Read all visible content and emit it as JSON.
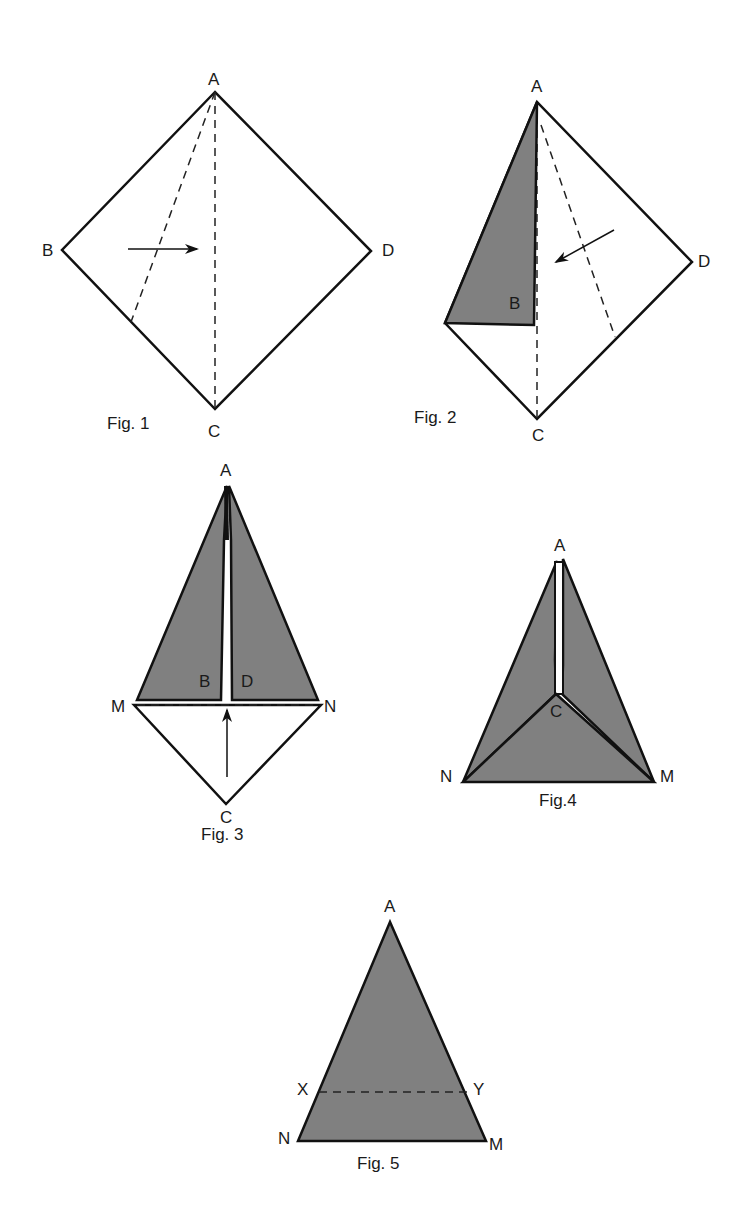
{
  "colors": {
    "shade": "#808080",
    "line": "#111111",
    "paper": "#ffffff"
  },
  "figures": [
    {
      "id": "fig1",
      "caption": "Fig. 1",
      "labels": {
        "A": "A",
        "B": "B",
        "C": "C",
        "D": "D"
      },
      "description": "Square ABCD with dashed diagonal AC and dashed fold line from A to BC; arrow points right (fold B toward AC)"
    },
    {
      "id": "fig2",
      "caption": "Fig. 2",
      "labels": {
        "A": "A",
        "B": "B",
        "C": "C",
        "D": "D"
      },
      "description": "B folded onto AC (shaded triangle); dashed fold line from A to CD; arrow points left-down (fold D toward AC)"
    },
    {
      "id": "fig3",
      "caption": "Fig. 3",
      "labels": {
        "A": "A",
        "B": "B",
        "D": "D",
        "M": "M",
        "N": "N",
        "C": "C"
      },
      "description": "Both flaps folded (shaded), dashed fold line MN; arrow points up (fold C up)"
    },
    {
      "id": "fig4",
      "caption": "Fig.4",
      "labels": {
        "A": "A",
        "C": "C",
        "N": "N",
        "M": "M"
      },
      "description": "Flipped over; C folded up forming triangle ANM with lines from C to N and M"
    },
    {
      "id": "fig5",
      "caption": "Fig. 5",
      "labels": {
        "A": "A",
        "X": "X",
        "Y": "Y",
        "N": "N",
        "M": "M"
      },
      "description": "Triangle ANM with dashed line XY parallel to NM"
    }
  ]
}
